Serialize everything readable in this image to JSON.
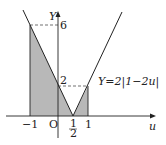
{
  "diagram": {
    "function_label": "Y=2|1−2u|",
    "axis_x_label": "u",
    "axis_y_label": "Y",
    "origin_label": "O",
    "x_ticks": {
      "neg_one": "−1",
      "half_num": "1",
      "half_den": "2",
      "one": "1"
    },
    "y_ticks": {
      "two": "2",
      "six": "6"
    },
    "colors": {
      "line": "#222222",
      "shade": "#b8b8b8"
    }
  }
}
